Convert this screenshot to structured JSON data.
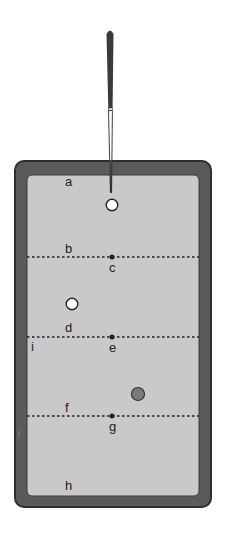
{
  "diagram": {
    "colors": {
      "rail": "#5a5a5a",
      "rail_edge": "#2e2e2e",
      "felt": "#c9c9c9",
      "cue": "#3a3a3a",
      "cue_ball": "#ffffff",
      "object_ball_white": "#ffffff",
      "object_ball_gray": "#7a7a7a",
      "marker": "#222222"
    },
    "labels": {
      "a": "a",
      "b": "b",
      "c": "c",
      "d": "d",
      "e": "e",
      "f": "f",
      "g": "g",
      "h": "h",
      "i": "i",
      "j": "j"
    },
    "balls": [
      {
        "id": "cue-ball",
        "color": "white"
      },
      {
        "id": "white-object-ball",
        "color": "white"
      },
      {
        "id": "gray-object-ball",
        "color": "gray"
      }
    ],
    "lines": [
      {
        "id": "line-b-c",
        "style": "dashed",
        "start_label": "b",
        "center_label": "c"
      },
      {
        "id": "line-d-e",
        "style": "dashed",
        "start_label": "d",
        "center_label": "e"
      },
      {
        "id": "line-f-g",
        "style": "dashed",
        "start_label": "f",
        "center_label": "g"
      }
    ]
  }
}
